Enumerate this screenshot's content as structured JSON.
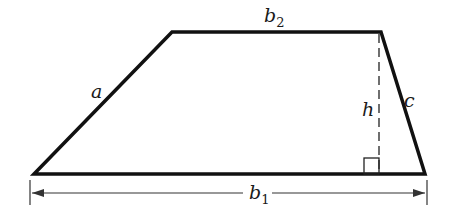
{
  "diagram": {
    "shape": "trapezoid",
    "labels": {
      "a": "a",
      "b1_main": "b",
      "b1_sub": "1",
      "b2_main": "b",
      "b2_sub": "2",
      "c": "c",
      "h": "h"
    },
    "colors": {
      "stroke": "#111111",
      "background": "#ffffff"
    }
  }
}
